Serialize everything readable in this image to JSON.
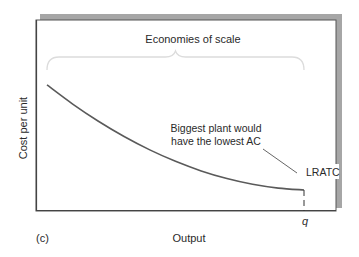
{
  "chart_data": {
    "type": "line",
    "title": "",
    "panel_label": "(c)",
    "xlabel": "Output",
    "ylabel": "Cost per unit",
    "xlim": [
      0,
      1
    ],
    "ylim": [
      0,
      1
    ],
    "grid": false,
    "legend": null,
    "series": [
      {
        "name": "LRATC",
        "x": [
          0.0,
          0.1,
          0.2,
          0.3,
          0.4,
          0.5,
          0.6,
          0.7,
          0.8,
          0.9,
          1.0
        ],
        "y": [
          0.66,
          0.56,
          0.47,
          0.39,
          0.32,
          0.26,
          0.21,
          0.17,
          0.14,
          0.12,
          0.11
        ]
      }
    ],
    "x_ticks": [
      {
        "value": 1.0,
        "label": "q"
      }
    ],
    "annotations": {
      "brace_label": "Economies of scale",
      "brace_range": [
        0.0,
        1.0
      ],
      "note_lines": [
        "Biggest plant would",
        "have the lowest AC"
      ],
      "curve_label": "LRATC",
      "dashed_drop_at": 1.0
    }
  }
}
